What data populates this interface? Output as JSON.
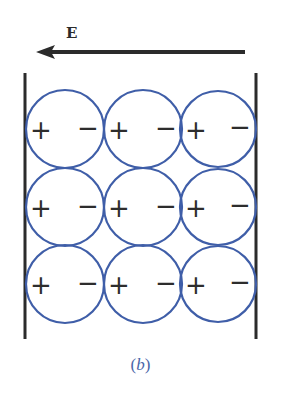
{
  "figure": {
    "field_label": "E",
    "field_direction": "left",
    "caption_open": "(",
    "caption_letter": "b",
    "caption_close": ")"
  },
  "colors": {
    "circle": "#3f5ea8",
    "plate": "#2b2b2b",
    "arrow": "#2b2b2b",
    "caption": "#4a66a8"
  },
  "grid": {
    "rows": 3,
    "cols": 3,
    "molecules": [
      {
        "row": 0,
        "col": 0,
        "left_sign": "+",
        "right_sign": "−"
      },
      {
        "row": 0,
        "col": 1,
        "left_sign": "+",
        "right_sign": "−"
      },
      {
        "row": 0,
        "col": 2,
        "left_sign": "+",
        "right_sign": "−"
      },
      {
        "row": 1,
        "col": 0,
        "left_sign": "+",
        "right_sign": "−"
      },
      {
        "row": 1,
        "col": 1,
        "left_sign": "+",
        "right_sign": "−"
      },
      {
        "row": 1,
        "col": 2,
        "left_sign": "+",
        "right_sign": "−"
      },
      {
        "row": 2,
        "col": 0,
        "left_sign": "+",
        "right_sign": "−"
      },
      {
        "row": 2,
        "col": 1,
        "left_sign": "+",
        "right_sign": "−"
      },
      {
        "row": 2,
        "col": 2,
        "left_sign": "+",
        "right_sign": "−"
      }
    ]
  }
}
